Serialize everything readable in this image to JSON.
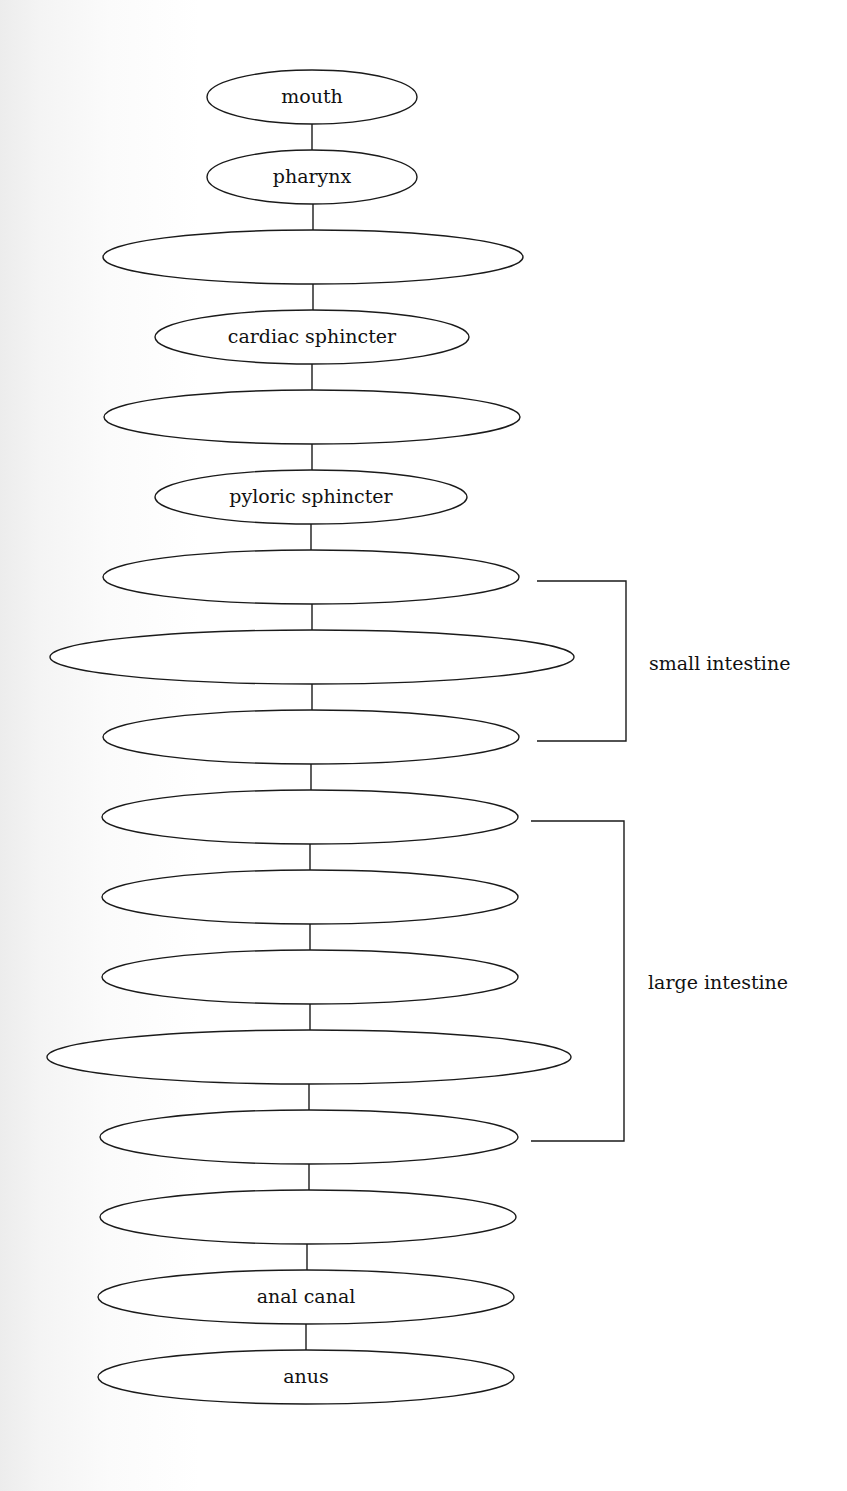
{
  "diagram": {
    "type": "flowchart",
    "orientation": "vertical",
    "nodes": [
      {
        "id": "n1",
        "label": "mouth",
        "cx": 312,
        "cy": 97,
        "rx": 105,
        "ry": 27
      },
      {
        "id": "n2",
        "label": "pharynx",
        "cx": 312,
        "cy": 177,
        "rx": 105,
        "ry": 27
      },
      {
        "id": "n3",
        "label": "",
        "cx": 313,
        "cy": 257,
        "rx": 210,
        "ry": 27
      },
      {
        "id": "n4",
        "label": "cardiac sphincter",
        "cx": 312,
        "cy": 337,
        "rx": 157,
        "ry": 27
      },
      {
        "id": "n5",
        "label": "",
        "cx": 312,
        "cy": 417,
        "rx": 208,
        "ry": 27
      },
      {
        "id": "n6",
        "label": "pyloric sphincter",
        "cx": 311,
        "cy": 497,
        "rx": 156,
        "ry": 27
      },
      {
        "id": "n7",
        "label": "",
        "cx": 311,
        "cy": 577,
        "rx": 208,
        "ry": 27
      },
      {
        "id": "n8",
        "label": "",
        "cx": 312,
        "cy": 657,
        "rx": 262,
        "ry": 27
      },
      {
        "id": "n9",
        "label": "",
        "cx": 311,
        "cy": 737,
        "rx": 208,
        "ry": 27
      },
      {
        "id": "n10",
        "label": "",
        "cx": 310,
        "cy": 817,
        "rx": 208,
        "ry": 27
      },
      {
        "id": "n11",
        "label": "",
        "cx": 310,
        "cy": 897,
        "rx": 208,
        "ry": 27
      },
      {
        "id": "n12",
        "label": "",
        "cx": 310,
        "cy": 977,
        "rx": 208,
        "ry": 27
      },
      {
        "id": "n13",
        "label": "",
        "cx": 309,
        "cy": 1057,
        "rx": 262,
        "ry": 27
      },
      {
        "id": "n14",
        "label": "",
        "cx": 309,
        "cy": 1137,
        "rx": 209,
        "ry": 27
      },
      {
        "id": "n15",
        "label": "",
        "cx": 308,
        "cy": 1217,
        "rx": 208,
        "ry": 27
      },
      {
        "id": "n16",
        "label": "anal canal",
        "cx": 306,
        "cy": 1297,
        "rx": 208,
        "ry": 27
      },
      {
        "id": "n17",
        "label": "anus",
        "cx": 306,
        "cy": 1377,
        "rx": 208,
        "ry": 27
      }
    ],
    "edges": [
      [
        "n1",
        "n2"
      ],
      [
        "n2",
        "n3"
      ],
      [
        "n3",
        "n4"
      ],
      [
        "n4",
        "n5"
      ],
      [
        "n5",
        "n6"
      ],
      [
        "n6",
        "n7"
      ],
      [
        "n7",
        "n8"
      ],
      [
        "n8",
        "n9"
      ],
      [
        "n9",
        "n10"
      ],
      [
        "n10",
        "n11"
      ],
      [
        "n11",
        "n12"
      ],
      [
        "n12",
        "n13"
      ],
      [
        "n13",
        "n14"
      ],
      [
        "n14",
        "n15"
      ],
      [
        "n15",
        "n16"
      ],
      [
        "n16",
        "n17"
      ]
    ],
    "groups": [
      {
        "id": "small-intestine",
        "label": "small intestine",
        "members": [
          "n7",
          "n8",
          "n9"
        ],
        "bracket": {
          "x1": 537,
          "x2": 626,
          "y_top": 581,
          "y_bottom": 741
        },
        "label_x": 649,
        "label_y": 663
      },
      {
        "id": "large-intestine",
        "label": "large intestine",
        "members": [
          "n10",
          "n11",
          "n12",
          "n13",
          "n14"
        ],
        "bracket": {
          "x1": 531,
          "x2": 624,
          "y_top": 821,
          "y_bottom": 1141
        },
        "label_x": 648,
        "label_y": 982
      }
    ]
  },
  "labels": {
    "mouth": "mouth",
    "pharynx": "pharynx",
    "cardiac_sphincter": "cardiac sphincter",
    "pyloric_sphincter": "pyloric sphincter",
    "anal_canal": "anal canal",
    "anus": "anus",
    "small_intestine": "small intestine",
    "large_intestine": "large intestine"
  },
  "colors": {
    "stroke": "#1a1a1a",
    "text": "#111111",
    "background": "#ffffff"
  }
}
